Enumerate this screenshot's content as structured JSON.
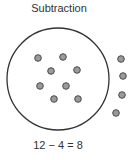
{
  "title": "Subtraction",
  "equation": "12 − 4 = 8",
  "colors": {
    "dot_fill": "#9a9a9a",
    "dot_stroke": "#4a4a4a",
    "circle_stroke": "#333333",
    "text": "#333333"
  },
  "set_circle": {
    "cx": 58,
    "cy": 79,
    "r": 51
  },
  "dots_inside": [
    {
      "x": 38,
      "y": 58
    },
    {
      "x": 63,
      "y": 57
    },
    {
      "x": 51,
      "y": 71
    },
    {
      "x": 77,
      "y": 70
    },
    {
      "x": 40,
      "y": 86
    },
    {
      "x": 66,
      "y": 86
    },
    {
      "x": 54,
      "y": 99
    },
    {
      "x": 78,
      "y": 99
    }
  ],
  "dots_removed": [
    {
      "x": 121,
      "y": 59
    },
    {
      "x": 123,
      "y": 76
    },
    {
      "x": 122,
      "y": 95
    },
    {
      "x": 116,
      "y": 113
    }
  ],
  "counts": {
    "total": 12,
    "removed": 4,
    "remaining": 8
  }
}
